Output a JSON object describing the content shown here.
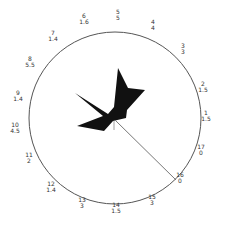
{
  "diagram": {
    "type": "circular-rose",
    "circle": {
      "cx": 115,
      "cy": 118,
      "r": 86,
      "stroke": "#555555"
    },
    "shape_fill": "#111111",
    "shape_points": "118,68 128,88 145,90 127,110 126,118 113,121 104,131 77,126 103,116 75,93 108,114 114,107",
    "pointer_line": {
      "x1": 115,
      "y1": 120,
      "x2": 176,
      "y2": 180
    },
    "tick": {
      "x1": 114,
      "y1": 121,
      "x2": 114,
      "y2": 130
    },
    "labels": [
      {
        "n": "1",
        "v": "1.5",
        "x": 206,
        "y": 116
      },
      {
        "n": "2",
        "v": "1.5",
        "x": 203,
        "y": 87
      },
      {
        "n": "3",
        "v": "3",
        "x": 183,
        "y": 49
      },
      {
        "n": "4",
        "v": "4",
        "x": 153,
        "y": 25
      },
      {
        "n": "5",
        "v": "5",
        "x": 118,
        "y": 15
      },
      {
        "n": "6",
        "v": "1.6",
        "x": 84,
        "y": 19
      },
      {
        "n": "7",
        "v": "1.4",
        "x": 53,
        "y": 36
      },
      {
        "n": "8",
        "v": "5.5",
        "x": 30,
        "y": 62
      },
      {
        "n": "9",
        "v": "1.4",
        "x": 18,
        "y": 96
      },
      {
        "n": "10",
        "v": "4.5",
        "x": 15,
        "y": 128
      },
      {
        "n": "11",
        "v": "2",
        "x": 29,
        "y": 158
      },
      {
        "n": "12",
        "v": "1.4",
        "x": 51,
        "y": 187
      },
      {
        "n": "13",
        "v": "3",
        "x": 82,
        "y": 203
      },
      {
        "n": "14",
        "v": "1.5",
        "x": 116,
        "y": 208
      },
      {
        "n": "15",
        "v": "3",
        "x": 152,
        "y": 200
      },
      {
        "n": "16",
        "v": "0",
        "x": 180,
        "y": 178
      },
      {
        "n": "17",
        "v": "0",
        "x": 201,
        "y": 150
      }
    ]
  }
}
